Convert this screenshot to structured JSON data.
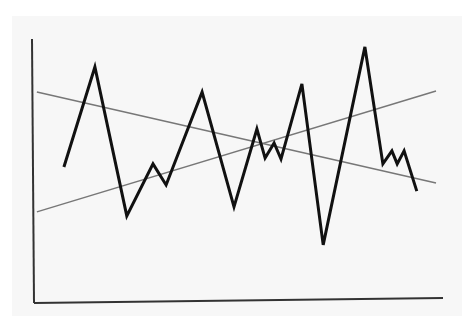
{
  "chart_data": {
    "type": "line",
    "title": "",
    "xlabel": "",
    "ylabel": "",
    "xlim": [
      0,
      100
    ],
    "ylim": [
      0,
      100
    ],
    "grid": false,
    "legend": "none",
    "series": [
      {
        "name": "volatile-series",
        "color": "#111111",
        "points": [
          [
            7.3,
            51.5
          ],
          [
            14.9,
            89.4
          ],
          [
            22.7,
            33.0
          ],
          [
            29.1,
            52.7
          ],
          [
            32.3,
            44.7
          ],
          [
            41.1,
            79.9
          ],
          [
            48.9,
            36.4
          ],
          [
            54.5,
            65.9
          ],
          [
            56.5,
            54.9
          ],
          [
            58.7,
            60.6
          ],
          [
            60.4,
            54.5
          ],
          [
            65.5,
            83.0
          ],
          [
            70.7,
            22.0
          ],
          [
            80.9,
            97.0
          ],
          [
            85.3,
            52.7
          ],
          [
            87.5,
            57.6
          ],
          [
            88.8,
            52.7
          ],
          [
            90.5,
            57.6
          ],
          [
            93.6,
            42.4
          ]
        ]
      },
      {
        "name": "rising-trendline",
        "color": "#777777",
        "points": [
          [
            0.7,
            34.5
          ],
          [
            98.3,
            80.3
          ]
        ]
      },
      {
        "name": "falling-trendline",
        "color": "#777777",
        "points": [
          [
            0.7,
            79.9
          ],
          [
            98.3,
            45.5
          ]
        ]
      }
    ]
  }
}
